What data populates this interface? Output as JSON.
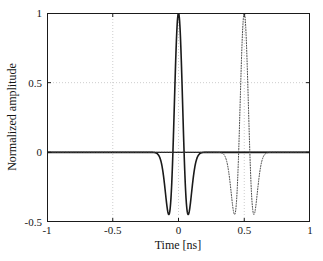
{
  "chart_data": {
    "type": "line",
    "title": "",
    "xlabel": "Time [ns]",
    "ylabel": "Normalized amplitude",
    "xlim": [
      -1,
      1
    ],
    "ylim": [
      -0.5,
      1
    ],
    "xticks": [
      "-1",
      "-0.5",
      "0",
      "0.5",
      "1"
    ],
    "xtick_values": [
      -1,
      -0.5,
      0,
      0.5,
      1
    ],
    "yticks": [
      "-0.5",
      "0",
      "0.5",
      "1"
    ],
    "ytick_values": [
      -0.5,
      0,
      0.5,
      1
    ],
    "grid": "dotted-light",
    "grid_x": [
      -0.5,
      0,
      0.5
    ],
    "grid_y": [
      0,
      0.5
    ],
    "legend": "none",
    "series": [
      {
        "name": "transmitted pulse",
        "style": "solid",
        "color": "#1a1a1a",
        "width": 1.6,
        "center": 0.0,
        "peak": 1.0,
        "lobe_min": -0.45,
        "lobe_time": 0.085,
        "half_support": 0.22,
        "shape": "second-derivative-gaussian",
        "sigma": 0.0425,
        "points_t": [
          -1.0,
          -0.9,
          -0.8,
          -0.7,
          -0.6,
          -0.5,
          -0.4,
          -0.3,
          -0.25,
          -0.22,
          -0.2,
          -0.18,
          -0.16,
          -0.14,
          -0.12,
          -0.11,
          -0.1,
          -0.095,
          -0.09,
          -0.085,
          -0.08,
          -0.075,
          -0.07,
          -0.06,
          -0.05,
          -0.04,
          -0.03,
          -0.02,
          -0.01,
          0.0,
          0.01,
          0.02,
          0.03,
          0.04,
          0.05,
          0.06,
          0.07,
          0.075,
          0.08,
          0.085,
          0.09,
          0.095,
          0.1,
          0.11,
          0.12,
          0.14,
          0.16,
          0.18,
          0.2,
          0.22,
          0.25,
          0.3,
          0.4,
          0.5,
          0.6,
          0.7,
          0.8,
          0.9,
          1.0
        ],
        "points_y": [
          0,
          0,
          0,
          0,
          0,
          0,
          0,
          0,
          -0.002,
          -0.01,
          -0.026,
          -0.058,
          -0.117,
          -0.205,
          -0.314,
          -0.366,
          -0.41,
          -0.428,
          -0.441,
          -0.45,
          -0.452,
          -0.449,
          -0.44,
          -0.398,
          -0.311,
          -0.174,
          0.006,
          0.21,
          0.412,
          0.58,
          0.412,
          0.21,
          0.006,
          -0.174,
          -0.311,
          -0.398,
          -0.44,
          -0.449,
          -0.452,
          -0.45,
          -0.441,
          -0.428,
          -0.41,
          -0.366,
          -0.314,
          -0.205,
          -0.117,
          -0.058,
          -0.026,
          -0.01,
          -0.002,
          0,
          0,
          0,
          0,
          0,
          0,
          0,
          0
        ]
      },
      {
        "name": "delayed / reflected pulse",
        "style": "dotted",
        "color": "#4a4a4a",
        "width": 1.0,
        "center": 0.5,
        "peak": 1.0,
        "lobe_min": -0.45,
        "lobe_time": 0.085,
        "half_support": 0.22,
        "shape": "second-derivative-gaussian",
        "sigma": 0.0425
      }
    ]
  },
  "axes": {
    "xlabel_text": "Time [ns]",
    "ylabel_text": "Normalized amplitude",
    "x_tick_labels": [
      "-1",
      "-0.5",
      "0",
      "0.5",
      "1"
    ],
    "y_tick_labels": [
      "1",
      "0.5",
      "0",
      "-0.5"
    ]
  },
  "colors": {
    "frame": "#1a1a1a",
    "solid_curve": "#1a1a1a",
    "dotted_curve": "#4a4a4a",
    "grid": "#b8b8b8",
    "background": "#ffffff",
    "text": "#151515"
  }
}
